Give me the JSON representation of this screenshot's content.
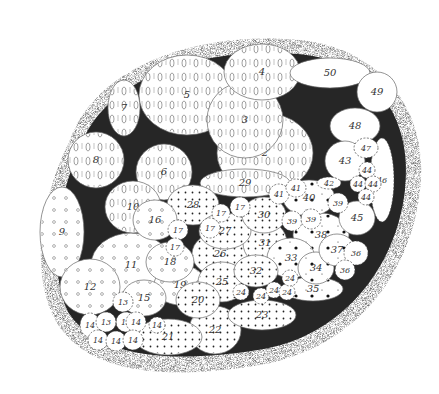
{
  "figure": {
    "colors": {
      "background": "#ffffff",
      "outer_halo": "#bdbdbd",
      "dark_matrix": "#2a2a2a",
      "lobe_fill": "#ffffff",
      "label": "#333333"
    },
    "pattern_legend": [
      {
        "pattern": "seed-glyph with dashes",
        "lobes": [
          "2",
          "3",
          "4",
          "5",
          "6",
          "7",
          "8",
          "10",
          "29"
        ]
      },
      {
        "pattern": "small open circles",
        "lobes": [
          "9",
          "11",
          "12",
          "13",
          "14",
          "15",
          "16",
          "17",
          "18",
          "19"
        ]
      },
      {
        "pattern": "dot stipple",
        "lobes": [
          "20",
          "21",
          "22",
          "23",
          "25",
          "26",
          "27",
          "28",
          "30",
          "31",
          "32"
        ]
      },
      {
        "pattern": "star dots",
        "lobes": [
          "33",
          "34",
          "35",
          "36",
          "37",
          "38",
          "39",
          "40",
          "41",
          "42"
        ]
      },
      {
        "pattern": "plain",
        "lobes": [
          "43",
          "44",
          "45",
          "46",
          "47",
          "48",
          "49",
          "50"
        ]
      }
    ],
    "lobes": [
      {
        "label": "2",
        "x": 265,
        "y": 153,
        "rx": 48,
        "ry": 40
      },
      {
        "label": "3",
        "x": 245,
        "y": 120,
        "rx": 38,
        "ry": 38
      },
      {
        "label": "4",
        "x": 262,
        "y": 72,
        "rx": 38,
        "ry": 28
      },
      {
        "label": "5",
        "x": 187,
        "y": 95,
        "rx": 48,
        "ry": 40
      },
      {
        "label": "6",
        "x": 164,
        "y": 172,
        "rx": 28,
        "ry": 28
      },
      {
        "label": "7",
        "x": 124,
        "y": 108,
        "rx": 16,
        "ry": 28
      },
      {
        "label": "8",
        "x": 96,
        "y": 160,
        "rx": 28,
        "ry": 28
      },
      {
        "label": "9",
        "x": 62,
        "y": 232,
        "rx": 22,
        "ry": 45
      },
      {
        "label": "10",
        "x": 133,
        "y": 207,
        "rx": 28,
        "ry": 26
      },
      {
        "label": "11",
        "x": 131,
        "y": 265,
        "rx": 40,
        "ry": 32
      },
      {
        "label": "12",
        "x": 90,
        "y": 287,
        "rx": 30,
        "ry": 28
      },
      {
        "label": "13",
        "x": 123,
        "y": 302,
        "rx": 10,
        "ry": 10
      },
      {
        "label": "13",
        "x": 126,
        "y": 322,
        "rx": 10,
        "ry": 10
      },
      {
        "label": "13",
        "x": 106,
        "y": 322,
        "rx": 10,
        "ry": 10
      },
      {
        "label": "14",
        "x": 90,
        "y": 325,
        "rx": 10,
        "ry": 12
      },
      {
        "label": "14",
        "x": 136,
        "y": 322,
        "rx": 10,
        "ry": 10
      },
      {
        "label": "14",
        "x": 157,
        "y": 325,
        "rx": 8,
        "ry": 8
      },
      {
        "label": "14",
        "x": 98,
        "y": 340,
        "rx": 10,
        "ry": 10
      },
      {
        "label": "14",
        "x": 116,
        "y": 341,
        "rx": 10,
        "ry": 10
      },
      {
        "label": "14",
        "x": 133,
        "y": 340,
        "rx": 10,
        "ry": 10
      },
      {
        "label": "15",
        "x": 144,
        "y": 298,
        "rx": 22,
        "ry": 18
      },
      {
        "label": "16",
        "x": 155,
        "y": 220,
        "rx": 22,
        "ry": 20
      },
      {
        "label": "17",
        "x": 178,
        "y": 230,
        "rx": 10,
        "ry": 10
      },
      {
        "label": "17",
        "x": 210,
        "y": 228,
        "rx": 10,
        "ry": 10
      },
      {
        "label": "17",
        "x": 240,
        "y": 207,
        "rx": 10,
        "ry": 10
      },
      {
        "label": "17",
        "x": 221,
        "y": 213,
        "rx": 9,
        "ry": 9
      },
      {
        "label": "17",
        "x": 175,
        "y": 247,
        "rx": 9,
        "ry": 9
      },
      {
        "label": "18",
        "x": 170,
        "y": 262,
        "rx": 24,
        "ry": 20
      },
      {
        "label": "19",
        "x": 180,
        "y": 285,
        "rx": 26,
        "ry": 20
      },
      {
        "label": "20",
        "x": 198,
        "y": 300,
        "rx": 22,
        "ry": 18
      },
      {
        "label": "21",
        "x": 168,
        "y": 337,
        "rx": 34,
        "ry": 18
      },
      {
        "label": "22",
        "x": 215,
        "y": 330,
        "rx": 26,
        "ry": 24
      },
      {
        "label": "23",
        "x": 262,
        "y": 315,
        "rx": 34,
        "ry": 15
      },
      {
        "label": "24",
        "x": 241,
        "y": 292,
        "rx": 8,
        "ry": 8
      },
      {
        "label": "24",
        "x": 261,
        "y": 296,
        "rx": 8,
        "ry": 8
      },
      {
        "label": "24",
        "x": 274,
        "y": 290,
        "rx": 8,
        "ry": 8
      },
      {
        "label": "24",
        "x": 287,
        "y": 292,
        "rx": 8,
        "ry": 8
      },
      {
        "label": "24",
        "x": 290,
        "y": 278,
        "rx": 8,
        "ry": 8
      },
      {
        "label": "25",
        "x": 222,
        "y": 282,
        "rx": 24,
        "ry": 20
      },
      {
        "label": "26",
        "x": 220,
        "y": 254,
        "rx": 28,
        "ry": 22
      },
      {
        "label": "27",
        "x": 225,
        "y": 231,
        "rx": 26,
        "ry": 18
      },
      {
        "label": "28",
        "x": 193,
        "y": 205,
        "rx": 26,
        "ry": 20
      },
      {
        "label": "29",
        "x": 245,
        "y": 183,
        "rx": 45,
        "ry": 14
      },
      {
        "label": "30",
        "x": 264,
        "y": 215,
        "rx": 22,
        "ry": 18
      },
      {
        "label": "31",
        "x": 265,
        "y": 243,
        "rx": 22,
        "ry": 22
      },
      {
        "label": "32",
        "x": 256,
        "y": 271,
        "rx": 22,
        "ry": 16
      },
      {
        "label": "33",
        "x": 291,
        "y": 258,
        "rx": 24,
        "ry": 20
      },
      {
        "label": "34",
        "x": 316,
        "y": 268,
        "rx": 18,
        "ry": 16
      },
      {
        "label": "35",
        "x": 313,
        "y": 289,
        "rx": 30,
        "ry": 12
      },
      {
        "label": "36",
        "x": 345,
        "y": 270,
        "rx": 10,
        "ry": 10
      },
      {
        "label": "36",
        "x": 356,
        "y": 253,
        "rx": 12,
        "ry": 12
      },
      {
        "label": "37",
        "x": 337,
        "y": 250,
        "rx": 18,
        "ry": 16
      },
      {
        "label": "38",
        "x": 321,
        "y": 235,
        "rx": 28,
        "ry": 22
      },
      {
        "label": "39",
        "x": 292,
        "y": 221,
        "rx": 10,
        "ry": 10
      },
      {
        "label": "39",
        "x": 311,
        "y": 219,
        "rx": 10,
        "ry": 10
      },
      {
        "label": "39",
        "x": 338,
        "y": 203,
        "rx": 10,
        "ry": 10
      },
      {
        "label": "40",
        "x": 309,
        "y": 198,
        "rx": 26,
        "ry": 18
      },
      {
        "label": "41",
        "x": 279,
        "y": 194,
        "rx": 10,
        "ry": 10
      },
      {
        "label": "41",
        "x": 296,
        "y": 188,
        "rx": 10,
        "ry": 9
      },
      {
        "label": "42",
        "x": 329,
        "y": 183,
        "rx": 12,
        "ry": 6
      },
      {
        "label": "43",
        "x": 345,
        "y": 161,
        "rx": 20,
        "ry": 20
      },
      {
        "label": "44",
        "x": 367,
        "y": 170,
        "rx": 8,
        "ry": 8
      },
      {
        "label": "44",
        "x": 358,
        "y": 184,
        "rx": 8,
        "ry": 8
      },
      {
        "label": "44",
        "x": 373,
        "y": 184,
        "rx": 8,
        "ry": 8
      },
      {
        "label": "44",
        "x": 366,
        "y": 197,
        "rx": 8,
        "ry": 8
      },
      {
        "label": "45",
        "x": 357,
        "y": 218,
        "rx": 18,
        "ry": 17
      },
      {
        "label": "46",
        "x": 382,
        "y": 180,
        "rx": 12,
        "ry": 42
      },
      {
        "label": "47",
        "x": 366,
        "y": 148,
        "rx": 12,
        "ry": 10
      },
      {
        "label": "48",
        "x": 355,
        "y": 126,
        "rx": 25,
        "ry": 18
      },
      {
        "label": "49",
        "x": 377,
        "y": 92,
        "rx": 20,
        "ry": 20
      },
      {
        "label": "50",
        "x": 330,
        "y": 73,
        "rx": 40,
        "ry": 15
      }
    ]
  }
}
